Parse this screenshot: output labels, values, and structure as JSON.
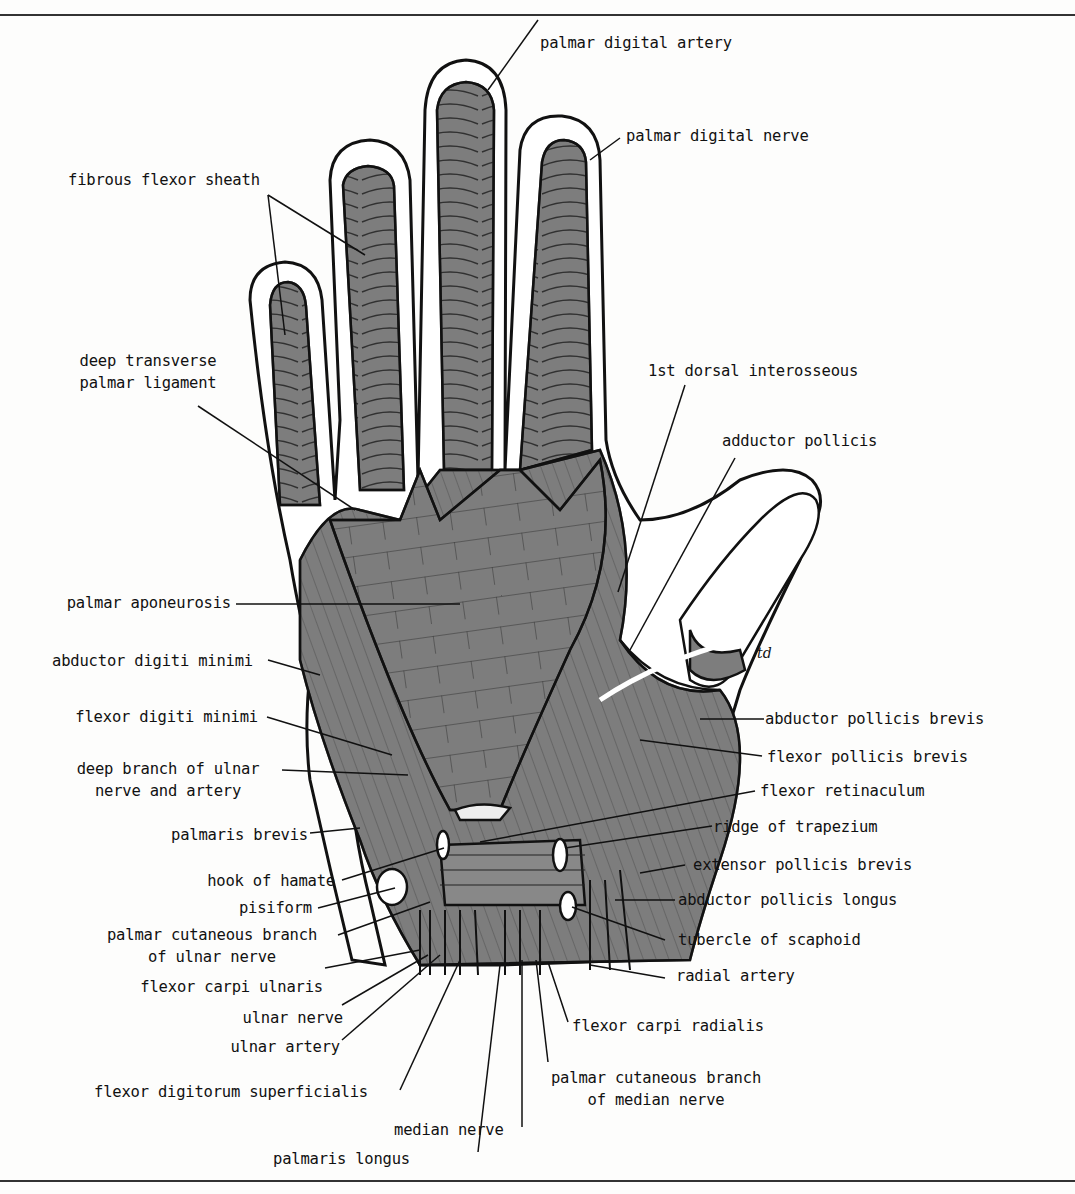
{
  "figure": {
    "artist_initials": "td",
    "colors": {
      "muscle": "#7d7d7d",
      "outline": "#111111",
      "sheath": "#ffffff",
      "background": "#fdfdfc"
    }
  },
  "labels": {
    "palmar_digital_artery": "palmar digital artery",
    "palmar_digital_nerve": "palmar digital nerve",
    "fibrous_flexor_sheath": "fibrous flexor sheath",
    "deep_transverse_palmar_ligament_1": "deep transverse",
    "deep_transverse_palmar_ligament_2": "palmar ligament",
    "first_dorsal_interosseous": "1st dorsal interosseous",
    "adductor_pollicis": "adductor pollicis",
    "palmar_aponeurosis": "palmar aponeurosis",
    "abductor_digiti_minimi": "abductor digiti minimi",
    "flexor_digiti_minimi": "flexor digiti minimi",
    "deep_branch_ulnar_1": "deep branch of ulnar",
    "deep_branch_ulnar_2": "nerve and artery",
    "palmaris_brevis": "palmaris brevis",
    "hook_of_hamate": "hook of hamate",
    "pisiform": "pisiform",
    "palmar_cutaneous_ulnar_1": "palmar cutaneous branch",
    "palmar_cutaneous_ulnar_2": "of ulnar nerve",
    "flexor_carpi_ulnaris": "flexor carpi ulnaris",
    "ulnar_nerve": "ulnar nerve",
    "ulnar_artery": "ulnar artery",
    "flexor_digitorum_superficialis": "flexor digitorum superficialis",
    "palmaris_longus": "palmaris longus",
    "median_nerve": "median nerve",
    "palmar_cutaneous_median_1": "palmar cutaneous branch",
    "palmar_cutaneous_median_2": "of median nerve",
    "flexor_carpi_radialis": "flexor carpi radialis",
    "radial_artery": "radial artery",
    "tubercle_of_scaphoid": "tubercle of scaphoid",
    "abductor_pollicis_longus": "abductor pollicis longus",
    "extensor_pollicis_brevis": "extensor pollicis brevis",
    "ridge_of_trapezium": "ridge of trapezium",
    "flexor_retinaculum": "flexor retinaculum",
    "flexor_pollicis_brevis": "flexor pollicis brevis",
    "abductor_pollicis_brevis": "abductor pollicis brevis"
  }
}
